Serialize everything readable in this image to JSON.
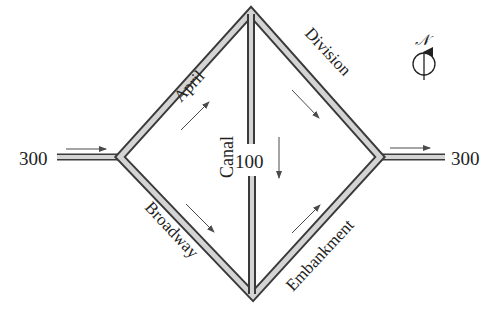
{
  "diagram": {
    "title": "",
    "type": "traffic-flow network",
    "streets": [
      {
        "name": "April",
        "from": "West junction",
        "to": "North junction"
      },
      {
        "name": "Division",
        "from": "North junction",
        "to": "East junction"
      },
      {
        "name": "Broadway",
        "from": "West junction",
        "to": "South junction"
      },
      {
        "name": "Embankment",
        "from": "South junction",
        "to": "East junction"
      },
      {
        "name": "Canal",
        "from": "North junction",
        "to": "South junction",
        "flow": "100"
      }
    ],
    "inflow": {
      "value": "300",
      "side": "west"
    },
    "outflow": {
      "value": "300",
      "side": "east"
    },
    "canal_flow": "100",
    "compass": {
      "label": "𝒩",
      "direction": "north"
    },
    "colors": {
      "road_edge": "#3a3a3a",
      "road_fill": "#d4d4d4",
      "arrow": "#4a4a4a",
      "text": "#222222"
    }
  },
  "labels": {
    "inflow": "300",
    "outflow": "300",
    "april": "April",
    "division": "Division",
    "broadway": "Broadway",
    "embankment": "Embankment",
    "canal": "Canal",
    "canal_flow": "100",
    "compass_n": "𝒩"
  }
}
